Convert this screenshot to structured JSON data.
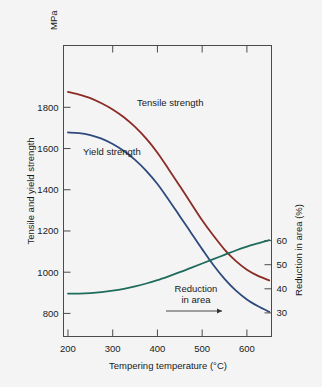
{
  "chart_data": {
    "type": "line",
    "title": "",
    "xlabel": "Tempering temperature (°C)",
    "ylabel": "Tensile and yield strength",
    "ylabel_right": "Reduction in area (%)",
    "y_unit": "MPa",
    "xlim": [
      190,
      655
    ],
    "ylim": [
      688,
      2100
    ],
    "ylim_right": [
      20.2,
      141.0
    ],
    "xticks": [
      200,
      300,
      400,
      500,
      600
    ],
    "xtick_labels": [
      "200",
      "300",
      "400",
      "500",
      "600"
    ],
    "yticks": [
      800,
      1000,
      1200,
      1400,
      1600,
      1800
    ],
    "ytick_labels": [
      "800",
      "1000",
      "1200",
      "1400",
      "1600",
      "1800"
    ],
    "yticks_right": [
      30,
      40,
      50,
      60
    ],
    "ytick_labels_right": [
      "30",
      "40",
      "50",
      "60"
    ],
    "grid": false,
    "legend_position": "inline-labels",
    "annotations": [
      {
        "name": "reduction-in-area-annotation",
        "line1": "Reduction",
        "line2": "in area",
        "arrow": "→"
      }
    ],
    "series": [
      {
        "name": "Tensile strength",
        "label": "Tensile strength",
        "color": "#8c2b24",
        "axis": "left",
        "x": [
          200,
          225,
          250,
          275,
          300,
          325,
          350,
          375,
          400,
          425,
          450,
          475,
          500,
          525,
          550,
          575,
          600,
          625,
          650
        ],
        "values": [
          1875,
          1862,
          1845,
          1820,
          1790,
          1752,
          1705,
          1648,
          1580,
          1500,
          1418,
          1335,
          1252,
          1178,
          1110,
          1055,
          1012,
          982,
          960
        ]
      },
      {
        "name": "Yield strength",
        "label": "Yield strength",
        "color": "#2e4a7d",
        "axis": "left",
        "x": [
          200,
          225,
          250,
          275,
          300,
          325,
          350,
          375,
          400,
          425,
          450,
          475,
          500,
          525,
          550,
          575,
          600,
          625,
          650
        ],
        "values": [
          1678,
          1675,
          1665,
          1648,
          1622,
          1588,
          1545,
          1492,
          1428,
          1352,
          1272,
          1192,
          1112,
          1035,
          968,
          912,
          868,
          835,
          808
        ]
      },
      {
        "name": "Reduction in area",
        "label": "Reduction in area",
        "color": "#1f6b5c",
        "axis": "right",
        "x": [
          200,
          225,
          250,
          275,
          300,
          325,
          350,
          375,
          400,
          425,
          450,
          475,
          500,
          525,
          550,
          575,
          600,
          625,
          650
        ],
        "values": [
          38.0,
          38.0,
          38.2,
          38.6,
          39.2,
          40.0,
          41.0,
          42.2,
          43.6,
          45.2,
          46.9,
          48.7,
          50.5,
          52.3,
          54.1,
          55.9,
          57.5,
          58.9,
          60.2
        ]
      }
    ]
  }
}
